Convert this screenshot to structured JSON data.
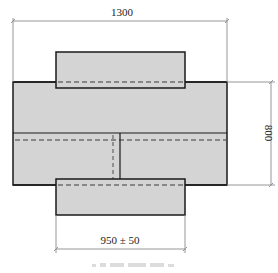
{
  "drawing": {
    "type": "technical-cross-section",
    "colors": {
      "fill": "#d4d4d4",
      "outline": "#1a1a1a",
      "dashed": "#6e6e6e",
      "dimension_line": "#8a8a8a",
      "background": "#ffffff",
      "caption": "#d0d0d0"
    },
    "dimensions": {
      "overall_width": "1300",
      "height": "800",
      "flange_width": "950 ± 50"
    },
    "caption": ""
  }
}
